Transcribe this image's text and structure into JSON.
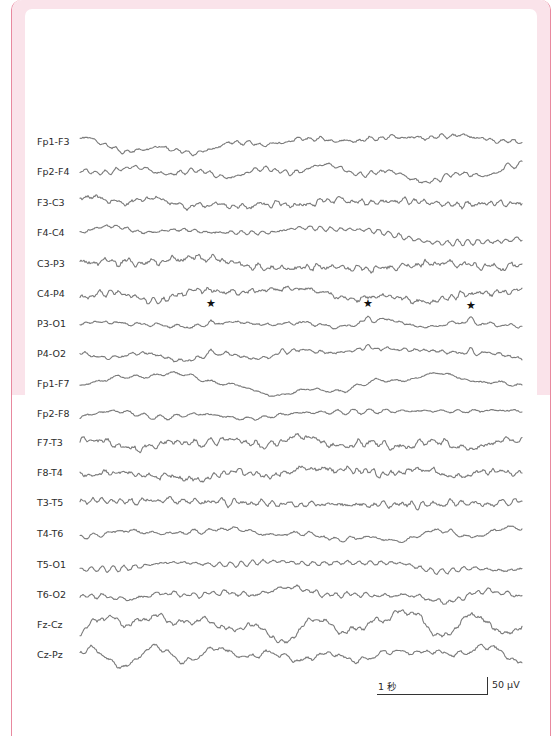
{
  "figure": {
    "type": "EEG bipolar montage recording",
    "colors": {
      "frame_border": "#e8899f",
      "frame_fill": "#fae3ea",
      "trace": "#7a7a7a",
      "text": "#2b2b2b",
      "star": "#111111"
    },
    "trace_x_start": 80,
    "trace_x_end": 522,
    "channels": [
      {
        "label": "Fp1-F3",
        "y": 142,
        "amp": 4.0,
        "seed": 11,
        "style": "slow"
      },
      {
        "label": "Fp2-F4",
        "y": 172,
        "amp": 4.0,
        "seed": 23,
        "style": "slow",
        "bumps": [
          {
            "x": 507,
            "h": 9
          }
        ]
      },
      {
        "label": "F3-C3",
        "y": 203,
        "amp": 3.2,
        "seed": 37,
        "style": "fast"
      },
      {
        "label": "F4-C4",
        "y": 233,
        "amp": 4.0,
        "seed": 41,
        "style": "slow"
      },
      {
        "label": "C3-P3",
        "y": 264,
        "amp": 4.2,
        "seed": 53,
        "style": "fast"
      },
      {
        "label": "C4-P4",
        "y": 294,
        "amp": 3.4,
        "seed": 67,
        "style": "fast"
      },
      {
        "label": "P3-O1",
        "y": 324,
        "amp": 3.6,
        "seed": 79,
        "style": "mixed",
        "bumps": [
          {
            "x": 211,
            "h": 9
          },
          {
            "x": 368,
            "h": 9
          },
          {
            "x": 471,
            "h": 7
          }
        ]
      },
      {
        "label": "P4-O2",
        "y": 354,
        "amp": 3.6,
        "seed": 83,
        "style": "mixed",
        "bumps": [
          {
            "x": 211,
            "h": 8
          },
          {
            "x": 283,
            "h": 7
          },
          {
            "x": 368,
            "h": 8
          },
          {
            "x": 471,
            "h": 7
          }
        ]
      },
      {
        "label": "Fp1-F7",
        "y": 384,
        "amp": 3.4,
        "seed": 97,
        "style": "slow"
      },
      {
        "label": "Fp2-F8",
        "y": 414,
        "amp": 3.4,
        "seed": 101,
        "style": "slow"
      },
      {
        "label": "F7-T3",
        "y": 443,
        "amp": 3.8,
        "seed": 113,
        "style": "fast"
      },
      {
        "label": "F8-T4",
        "y": 473,
        "amp": 3.8,
        "seed": 127,
        "style": "fast"
      },
      {
        "label": "T3-T5",
        "y": 503,
        "amp": 3.4,
        "seed": 131,
        "style": "fast"
      },
      {
        "label": "T4-T6",
        "y": 534,
        "amp": 3.8,
        "seed": 149,
        "style": "mixed"
      },
      {
        "label": "T5-O1",
        "y": 565,
        "amp": 3.8,
        "seed": 157,
        "style": "mixed"
      },
      {
        "label": "T6-O2",
        "y": 595,
        "amp": 4.2,
        "seed": 163,
        "style": "mixed"
      },
      {
        "label": "Fz-Cz",
        "y": 625,
        "amp": 6.0,
        "seed": 173,
        "style": "theta"
      },
      {
        "label": "Cz-Pz",
        "y": 655,
        "amp": 5.5,
        "seed": 181,
        "style": "theta"
      }
    ],
    "markers": [
      {
        "symbol": "★",
        "x": 211,
        "y": 304,
        "channel": "P3-O1"
      },
      {
        "symbol": "★",
        "x": 368,
        "y": 304,
        "channel": "P3-O1"
      },
      {
        "symbol": "★",
        "x": 471,
        "y": 306,
        "channel": "P3-O1"
      }
    ],
    "scale_bar": {
      "time_label": "1 秒",
      "amplitude_label": "50 μV"
    }
  }
}
